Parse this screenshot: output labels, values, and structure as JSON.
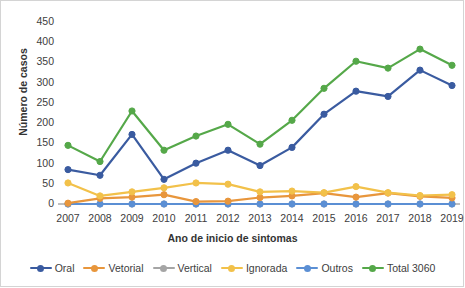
{
  "chart_data": {
    "type": "line",
    "title": "",
    "xlabel": "Ano de inicio de sintomas",
    "ylabel": "Número de casos",
    "categories": [
      "2007",
      "2008",
      "2009",
      "2010",
      "2011",
      "2012",
      "2013",
      "2014",
      "2015",
      "2016",
      "2017",
      "2018",
      "2019"
    ],
    "ylim": [
      0,
      450
    ],
    "yticks": [
      0,
      50,
      100,
      150,
      200,
      250,
      300,
      350,
      400,
      450
    ],
    "grid": false,
    "legend_position": "bottom",
    "series": [
      {
        "name": "Oral",
        "color": "#3A5BA0",
        "values": [
          85,
          71,
          172,
          61,
          101,
          133,
          95,
          140,
          222,
          279,
          266,
          331,
          293
        ]
      },
      {
        "name": "Vetorial",
        "color": "#E8963C",
        "values": [
          2,
          14,
          17,
          23,
          6,
          7,
          16,
          20,
          27,
          17,
          27,
          19,
          15
        ]
      },
      {
        "name": "Vertical",
        "color": "#A5A5A5",
        "values": [
          0,
          0,
          0,
          0,
          0,
          0,
          0,
          0,
          0,
          0,
          0,
          0,
          0
        ]
      },
      {
        "name": "Ignorada",
        "color": "#F2C14A",
        "values": [
          52,
          20,
          30,
          40,
          52,
          49,
          30,
          32,
          28,
          43,
          28,
          21,
          23
        ]
      },
      {
        "name": "Outros",
        "color": "#5B8FD4",
        "values": [
          0,
          0,
          0,
          0,
          0,
          0,
          0,
          0,
          0,
          0,
          0,
          0,
          0
        ]
      },
      {
        "name": "Total 3060",
        "color": "#55A849",
        "values": [
          145,
          105,
          230,
          133,
          168,
          197,
          148,
          207,
          286,
          353,
          336,
          383,
          343
        ]
      }
    ]
  }
}
